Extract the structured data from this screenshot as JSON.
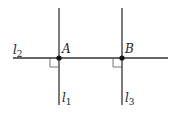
{
  "diagram": {
    "type": "geometry-perpendicular-lines",
    "colors": {
      "line": "#333333",
      "point": "#111111",
      "text": "#222222",
      "background": "#ffffff"
    },
    "lines": [
      {
        "id": "l1",
        "label": "l",
        "subscript": "1",
        "orientation": "vertical",
        "x": 59,
        "y1": 8,
        "y2": 105
      },
      {
        "id": "l2",
        "label": "l",
        "subscript": "2",
        "orientation": "horizontal",
        "y": 58,
        "x1": 13,
        "x2": 168
      },
      {
        "id": "l3",
        "label": "l",
        "subscript": "3",
        "orientation": "vertical",
        "x": 122,
        "y1": 8,
        "y2": 105
      }
    ],
    "points": [
      {
        "id": "A",
        "label": "A",
        "x": 59,
        "y": 58
      },
      {
        "id": "B",
        "label": "B",
        "x": 122,
        "y": 58
      }
    ],
    "right_angle_markers": [
      {
        "at": "A",
        "quadrant": "lower-left",
        "size": 9
      },
      {
        "at": "B",
        "quadrant": "lower-left",
        "size": 9
      }
    ]
  },
  "labels": {
    "l1": {
      "main": "l",
      "sub": "1"
    },
    "l2": {
      "main": "l",
      "sub": "2"
    },
    "l3": {
      "main": "l",
      "sub": "3"
    },
    "A": "A",
    "B": "B"
  }
}
